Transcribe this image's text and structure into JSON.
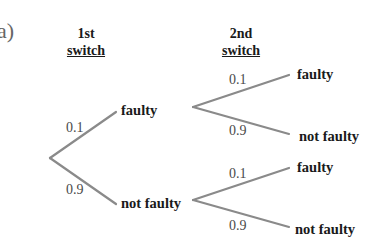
{
  "part_label": "a)",
  "headers": {
    "first": {
      "line1": "1st",
      "line2": "switch"
    },
    "second": {
      "line1": "2nd",
      "line2": "switch"
    }
  },
  "stage1": {
    "upper": {
      "prob": "0.1",
      "outcome": "faulty"
    },
    "lower": {
      "prob": "0.9",
      "outcome": "not faulty"
    }
  },
  "stage2": {
    "after_faulty": {
      "upper": {
        "prob": "0.1",
        "outcome": "faulty"
      },
      "lower": {
        "prob": "0.9",
        "outcome": "not faulty"
      }
    },
    "after_not_faulty": {
      "upper": {
        "prob": "0.1",
        "outcome": "faulty"
      },
      "lower": {
        "prob": "0.9",
        "outcome": "not faulty"
      }
    }
  },
  "colors": {
    "branch": "#8a8a8a",
    "text": "#1a1a1a",
    "prob": "#4a4a4a"
  }
}
